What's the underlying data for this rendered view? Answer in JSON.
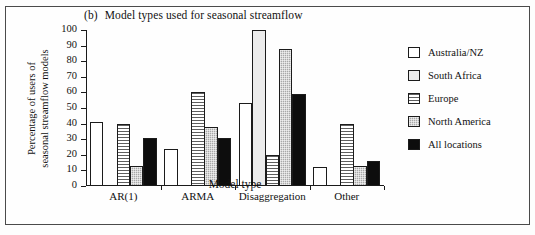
{
  "figure": {
    "panel_tag": "(b)",
    "title": "Model types used for seasonal streamflow"
  },
  "chart_data": {
    "type": "bar",
    "xlabel": "Model type",
    "ylabel": "Percentage of users of seasonal streamflow models",
    "ylabel_line1": "Percentage of users of",
    "ylabel_line2": "seasonal streamflow models",
    "categories": [
      "AR(1)",
      "ARMA",
      "Disaggregation",
      "Other"
    ],
    "ylim": [
      0,
      100
    ],
    "yticks": [
      0,
      10,
      20,
      30,
      40,
      50,
      60,
      70,
      80,
      90,
      100
    ],
    "ytick_labels": [
      "0",
      "10",
      "20",
      "30",
      "40",
      "50",
      "60",
      "70",
      "80",
      "90",
      "100"
    ],
    "grid": false,
    "legend_position": "right",
    "series": [
      {
        "name": "Australia/NZ",
        "fill": "white",
        "color": "#ffffff",
        "values": [
          41,
          24,
          53,
          12
        ]
      },
      {
        "name": "South Africa",
        "fill": "very-light-gray",
        "color": "#ececec",
        "values": [
          0,
          0,
          100,
          0
        ]
      },
      {
        "name": "Europe",
        "fill": "horizontal-stripes",
        "color": "#5e5e5e",
        "values": [
          40,
          60,
          20,
          40
        ]
      },
      {
        "name": "North America",
        "fill": "gray-checker",
        "color": "#a8a8a8",
        "values": [
          13,
          38,
          88,
          13
        ]
      },
      {
        "name": "All locations",
        "fill": "solid-black",
        "color": "#0d0d0d",
        "values": [
          31,
          31,
          59,
          16
        ]
      }
    ]
  }
}
